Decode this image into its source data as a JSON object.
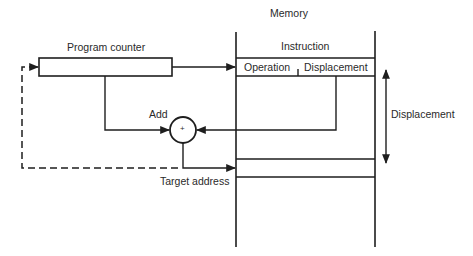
{
  "diagram": {
    "type": "flow",
    "labels": {
      "memory": "Memory",
      "instruction": "Instruction",
      "operation": "Operation",
      "displacement_field": "Displacement",
      "program_counter": "Program counter",
      "add": "Add",
      "adder_symbol": "+",
      "target_address": "Target address",
      "displacement_span": "Displacement"
    },
    "nodes": [
      {
        "id": "program-counter",
        "label": "Program counter",
        "shape": "rectangle"
      },
      {
        "id": "memory",
        "label": "Memory",
        "shape": "column"
      },
      {
        "id": "instruction",
        "label": "Instruction",
        "fields": [
          "Operation",
          "Displacement"
        ]
      },
      {
        "id": "adder",
        "label": "Add",
        "shape": "circle",
        "symbol": "+"
      },
      {
        "id": "target-address",
        "label": "Target address",
        "shape": "memory-cell"
      }
    ],
    "edges": [
      {
        "from": "program-counter",
        "to": "instruction",
        "style": "solid"
      },
      {
        "from": "program-counter",
        "to": "adder",
        "style": "solid"
      },
      {
        "from": "instruction.displacement",
        "to": "adder",
        "style": "solid"
      },
      {
        "from": "adder",
        "to": "target-address",
        "style": "solid"
      },
      {
        "from": "adder",
        "to": "program-counter",
        "style": "dashed"
      }
    ],
    "annotations": [
      {
        "label": "Displacement",
        "type": "double-arrow",
        "between": [
          "instruction",
          "target-address"
        ]
      }
    ],
    "colors": {
      "line": "#1e1e1e",
      "text": "#2a2a2a",
      "background": "#ffffff"
    }
  }
}
